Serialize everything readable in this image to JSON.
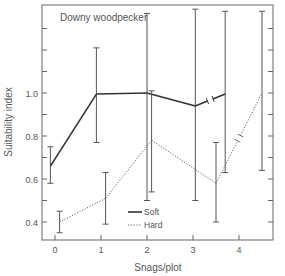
{
  "chart_data": {
    "type": "line",
    "title": "Downy woodpecker",
    "xlabel": "Snags/plot",
    "ylabel": "Suitability index",
    "xlim": [
      -0.3,
      4.7
    ],
    "ylim": [
      0.32,
      1.41
    ],
    "x_ticks": [
      0,
      1,
      2,
      3,
      4
    ],
    "y_tick_labels": [
      "0.4",
      "0.6",
      "0.8",
      "1.0"
    ],
    "y_tick_values": [
      0.4,
      0.5,
      0.6,
      0.7,
      0.8,
      0.9,
      1.0,
      1.1,
      1.2,
      1.3
    ],
    "grid": false,
    "legend": {
      "position": "lower-right",
      "entries": [
        "Soft",
        "Hard"
      ]
    },
    "series": [
      {
        "name": "Soft",
        "style": "solid",
        "color": "#333333",
        "x": [
          -0.1,
          0.9,
          2.0,
          3.05,
          3.7
        ],
        "y": [
          0.66,
          0.995,
          1.0,
          0.94,
          0.995
        ],
        "err_low": [
          0.58,
          0.77,
          0.5,
          0.5,
          0.63
        ],
        "err_high": [
          0.75,
          1.21,
          1.37,
          1.39,
          1.38
        ],
        "axis_break_between": [
          3.05,
          3.7
        ]
      },
      {
        "name": "Hard",
        "style": "dotted",
        "color": "#666666",
        "x": [
          0.1,
          1.1,
          2.1,
          3.5,
          4.5
        ],
        "y": [
          0.4,
          0.51,
          0.78,
          0.58,
          1.0
        ],
        "err_low": [
          0.35,
          0.39,
          0.54,
          0.4,
          0.64
        ],
        "err_high": [
          0.45,
          0.63,
          1.01,
          0.77,
          1.38
        ],
        "axis_break_between": [
          3.5,
          4.5
        ]
      }
    ]
  }
}
